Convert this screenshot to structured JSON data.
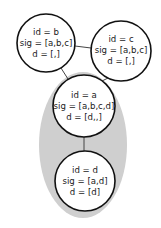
{
  "diagram": {
    "group": {
      "fill": "#cfcfcf",
      "cx": 83,
      "cy": 145,
      "rx": 44,
      "ry": 73
    },
    "nodes": [
      {
        "key": "b",
        "cx": 46,
        "cy": 43,
        "r": 29,
        "lines": [
          "id = b",
          "sig = [a,b,c]",
          "d = [,]"
        ]
      },
      {
        "key": "c",
        "cx": 121,
        "cy": 51,
        "r": 30,
        "lines": [
          "id = c",
          "sig = [a,b,c]",
          "d = [,]"
        ]
      },
      {
        "key": "a",
        "cx": 84,
        "cy": 106,
        "r": 31,
        "lines": [
          "id = a",
          "sig = [a,b,c,d]",
          "d = [d,,]"
        ]
      },
      {
        "key": "d",
        "cx": 85,
        "cy": 181,
        "r": 30,
        "lines": [
          "id = d",
          "sig = [a,d]",
          "d = [d]"
        ]
      }
    ],
    "edges": [
      {
        "from": "b",
        "to": "c"
      },
      {
        "from": "b",
        "to": "a"
      },
      {
        "from": "c",
        "to": "a"
      },
      {
        "from": "a",
        "to": "d"
      }
    ],
    "colors": {
      "stroke": "#111111",
      "node_fill": "#ffffff",
      "edge": "#444444"
    }
  }
}
